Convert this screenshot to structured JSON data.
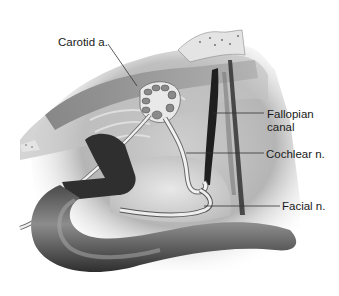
{
  "figure": {
    "labels": [
      {
        "id": "carotid",
        "text": "Carotid a."
      },
      {
        "id": "fallopian",
        "text": "Fallopian\ncanal",
        "lines": [
          "Fallopian",
          "canal"
        ]
      },
      {
        "id": "cochlear",
        "text": "Cochlear n."
      },
      {
        "id": "facial",
        "text": "Facial n."
      }
    ],
    "colors": {
      "background": "#ffffff",
      "label_text": "#1a1a1a",
      "leader_line": "#333333",
      "vessel_dark": "#2b2b2b",
      "bone_light": "#d9d9d9",
      "tissue_mid": "#9a9a9a"
    }
  }
}
